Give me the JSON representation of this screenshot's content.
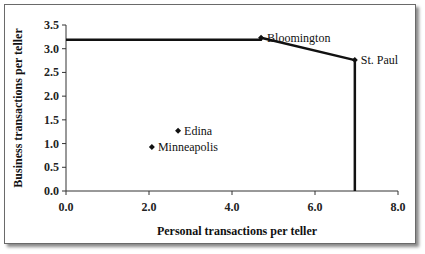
{
  "chart_data": {
    "type": "scatter",
    "title": "",
    "xlabel": "Personal transactions per teller",
    "ylabel": "Business transactions per teller",
    "xlim": [
      0,
      8
    ],
    "ylim": [
      0,
      3.5
    ],
    "x_ticks": [
      "0.0",
      "2.0",
      "4.0",
      "6.0",
      "8.0"
    ],
    "y_ticks": [
      "0.0",
      "0.5",
      "1.0",
      "1.5",
      "2.0",
      "2.5",
      "3.0",
      "3.5"
    ],
    "grid": false,
    "legend": null,
    "series": [
      {
        "name": "Branches",
        "points": [
          {
            "label": "Bloomington",
            "x": 4.7,
            "y": 3.23
          },
          {
            "label": "St. Paul",
            "x": 6.96,
            "y": 2.76
          },
          {
            "label": "Edina",
            "x": 2.7,
            "y": 1.27
          },
          {
            "label": "Minneapolis",
            "x": 2.07,
            "y": 0.93
          }
        ]
      },
      {
        "name": "Efficient frontier",
        "type": "line",
        "points": [
          {
            "x": 0.0,
            "y": 3.19
          },
          {
            "x": 4.7,
            "y": 3.19
          },
          {
            "x": 4.7,
            "y": 3.23
          },
          {
            "x": 6.96,
            "y": 2.76
          },
          {
            "x": 6.96,
            "y": 0.0
          }
        ]
      }
    ]
  }
}
